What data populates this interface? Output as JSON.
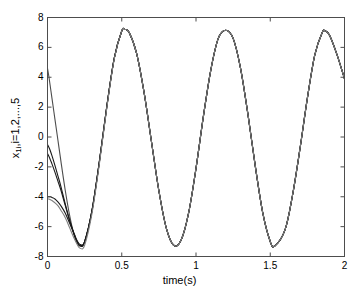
{
  "figure": {
    "background_color": "#ffffff",
    "axis_color": "#4d4d4d",
    "text_color": "#000000"
  },
  "axes": {
    "xlabel": "time(s)",
    "ylabel_prefix": "x",
    "ylabel_sub": "1i",
    "ylabel_suffix": ",i=1,2,...,5",
    "ylabel_full": "x1i,i=1,2,...,5",
    "xticks": [
      "0",
      "0.5",
      "1",
      "1.5",
      "2"
    ],
    "yticks": [
      "8",
      "6",
      "4",
      "2",
      "0",
      "-2",
      "-4",
      "-6",
      "-8"
    ]
  },
  "chart_data": {
    "type": "line",
    "title": "",
    "xlabel": "time(s)",
    "ylabel": "x1i,i=1,2,...,5",
    "xlim": [
      0,
      2
    ],
    "ylim": [
      -8,
      8
    ],
    "xticks": [
      0,
      0.5,
      1,
      1.5,
      2
    ],
    "yticks": [
      -8,
      -6,
      -4,
      -2,
      0,
      2,
      4,
      6,
      8
    ],
    "grid": false,
    "legend": "none",
    "annotations": [],
    "steady_state": {
      "amplitude": 7.2,
      "period": 0.675,
      "peaks_t": [
        0.52,
        1.2,
        1.87
      ],
      "peaks_y": [
        7.2,
        7.15,
        7.1
      ],
      "troughs_t": [
        0.85,
        1.53
      ],
      "troughs_y": [
        -7.25,
        -7.3
      ]
    },
    "series": [
      {
        "name": "x11",
        "color": "#4d4d4d",
        "initial_value": 4.6,
        "x": [
          0,
          0.01,
          0.02,
          0.03,
          0.05,
          0.07,
          0.09,
          0.12,
          0.15,
          0.18,
          0.2,
          0.22,
          0.25,
          0.3,
          0.35,
          0.4,
          0.45,
          0.5,
          0.52,
          0.55,
          0.6,
          0.65,
          0.7,
          0.75,
          0.8,
          0.85,
          0.9,
          0.95,
          1.0,
          1.05,
          1.1,
          1.15,
          1.2,
          1.25,
          1.3,
          1.35,
          1.4,
          1.45,
          1.5,
          1.53,
          1.6,
          1.65,
          1.7,
          1.75,
          1.8,
          1.85,
          1.87,
          1.9,
          1.95,
          2.0
        ],
        "y": [
          4.6,
          4.0,
          3.3,
          2.6,
          1.2,
          -0.2,
          -1.6,
          -3.6,
          -5.3,
          -6.6,
          -7.1,
          -7.3,
          -7.0,
          -4.9,
          -1.6,
          2.1,
          5.3,
          7.1,
          7.2,
          7.0,
          5.6,
          3.0,
          -0.3,
          -3.6,
          -6.1,
          -7.25,
          -6.9,
          -5.1,
          -2.1,
          1.4,
          4.5,
          6.6,
          7.15,
          6.6,
          4.6,
          1.5,
          -2.0,
          -5.1,
          -7.0,
          -7.3,
          -6.2,
          -3.9,
          -0.8,
          2.6,
          5.5,
          7.0,
          7.1,
          6.8,
          5.5,
          3.9
        ]
      },
      {
        "name": "x12",
        "color": "#1a1a1a",
        "initial_value": -0.5,
        "x": [
          0,
          0.01,
          0.02,
          0.03,
          0.05,
          0.07,
          0.09,
          0.12,
          0.15,
          0.18,
          0.2,
          0.22,
          0.25,
          0.3,
          0.35,
          0.4,
          0.45,
          0.5,
          0.52,
          0.55,
          0.6,
          0.65,
          0.7,
          0.75,
          0.8,
          0.85,
          0.9,
          0.95,
          1.0,
          1.05,
          1.1,
          1.15,
          1.2,
          1.25,
          1.3,
          1.35,
          1.4,
          1.45,
          1.5,
          1.53,
          1.6,
          1.65,
          1.7,
          1.75,
          1.8,
          1.85,
          1.87,
          1.9,
          1.95,
          2.0
        ],
        "y": [
          -0.5,
          -0.7,
          -0.95,
          -1.25,
          -1.9,
          -2.6,
          -3.3,
          -4.5,
          -5.6,
          -6.5,
          -7.0,
          -7.25,
          -7.0,
          -4.9,
          -1.6,
          2.1,
          5.3,
          7.1,
          7.2,
          7.0,
          5.6,
          3.0,
          -0.3,
          -3.6,
          -6.1,
          -7.25,
          -6.9,
          -5.1,
          -2.1,
          1.4,
          4.5,
          6.6,
          7.15,
          6.6,
          4.6,
          1.5,
          -2.0,
          -5.1,
          -7.0,
          -7.3,
          -6.2,
          -3.9,
          -0.8,
          2.6,
          5.5,
          7.0,
          7.1,
          6.8,
          5.5,
          3.9
        ]
      },
      {
        "name": "x13",
        "color": "#1a1a1a",
        "initial_value": -1.1,
        "x": [
          0,
          0.01,
          0.02,
          0.03,
          0.05,
          0.07,
          0.09,
          0.12,
          0.15,
          0.18,
          0.2,
          0.22,
          0.25,
          0.3,
          0.35,
          0.4,
          0.45,
          0.5,
          0.52,
          0.55,
          0.6,
          0.65,
          0.7,
          0.75,
          0.8,
          0.85,
          0.9,
          0.95,
          1.0,
          1.05,
          1.1,
          1.15,
          1.2,
          1.25,
          1.3,
          1.35,
          1.4,
          1.45,
          1.5,
          1.53,
          1.6,
          1.65,
          1.7,
          1.75,
          1.8,
          1.85,
          1.87,
          1.9,
          1.95,
          2.0
        ],
        "y": [
          -1.1,
          -1.3,
          -1.55,
          -1.8,
          -2.35,
          -2.95,
          -3.55,
          -4.6,
          -5.65,
          -6.55,
          -7.05,
          -7.3,
          -7.05,
          -4.9,
          -1.6,
          2.1,
          5.3,
          7.1,
          7.2,
          7.0,
          5.6,
          3.0,
          -0.3,
          -3.6,
          -6.1,
          -7.25,
          -6.9,
          -5.1,
          -2.1,
          1.4,
          4.5,
          6.6,
          7.15,
          6.6,
          4.6,
          1.5,
          -2.0,
          -5.1,
          -7.0,
          -7.3,
          -6.2,
          -3.9,
          -0.8,
          2.6,
          5.5,
          7.0,
          7.1,
          6.8,
          5.5,
          3.9
        ]
      },
      {
        "name": "x14",
        "color": "#1a1a1a",
        "initial_value": -4.0,
        "x": [
          0,
          0.01,
          0.02,
          0.03,
          0.05,
          0.07,
          0.09,
          0.12,
          0.15,
          0.18,
          0.2,
          0.22,
          0.25,
          0.3,
          0.35,
          0.4,
          0.45,
          0.5,
          0.52,
          0.55,
          0.6,
          0.65,
          0.7,
          0.75,
          0.8,
          0.85,
          0.9,
          0.95,
          1.0,
          1.05,
          1.1,
          1.15,
          1.2,
          1.25,
          1.3,
          1.35,
          1.4,
          1.45,
          1.5,
          1.53,
          1.6,
          1.65,
          1.7,
          1.75,
          1.8,
          1.85,
          1.87,
          1.9,
          1.95,
          2.0
        ],
        "y": [
          -4.0,
          -4.0,
          -4.0,
          -4.05,
          -4.15,
          -4.35,
          -4.6,
          -5.1,
          -5.8,
          -6.5,
          -6.95,
          -7.2,
          -7.0,
          -4.95,
          -1.65,
          2.05,
          5.3,
          7.1,
          7.2,
          7.0,
          5.6,
          3.0,
          -0.3,
          -3.6,
          -6.1,
          -7.25,
          -6.9,
          -5.1,
          -2.1,
          1.4,
          4.5,
          6.6,
          7.15,
          6.6,
          4.6,
          1.5,
          -2.0,
          -5.1,
          -7.0,
          -7.3,
          -6.2,
          -3.9,
          -0.8,
          2.6,
          5.5,
          7.0,
          7.1,
          6.8,
          5.5,
          3.9
        ]
      },
      {
        "name": "x15",
        "color": "#808080",
        "initial_value": -4.15,
        "x": [
          0,
          0.01,
          0.02,
          0.03,
          0.05,
          0.07,
          0.09,
          0.12,
          0.15,
          0.18,
          0.2,
          0.22,
          0.25,
          0.3,
          0.35,
          0.4,
          0.45,
          0.5,
          0.52,
          0.55,
          0.6,
          0.65,
          0.7,
          0.75,
          0.8,
          0.85,
          0.9,
          0.95,
          1.0,
          1.05,
          1.1,
          1.15,
          1.2,
          1.25,
          1.3,
          1.35,
          1.4,
          1.45,
          1.5,
          1.53,
          1.6,
          1.65,
          1.7,
          1.75,
          1.8,
          1.85,
          1.87,
          1.9,
          1.95,
          2.0
        ],
        "y": [
          -4.15,
          -4.15,
          -4.2,
          -4.25,
          -4.4,
          -4.6,
          -4.9,
          -5.4,
          -6.1,
          -6.8,
          -7.2,
          -7.45,
          -7.25,
          -5.1,
          -1.75,
          2.0,
          5.25,
          7.1,
          7.2,
          7.0,
          5.6,
          3.0,
          -0.3,
          -3.6,
          -6.1,
          -7.25,
          -6.9,
          -5.1,
          -2.1,
          1.4,
          4.5,
          6.6,
          7.15,
          6.6,
          4.6,
          1.5,
          -2.0,
          -5.1,
          -7.0,
          -7.3,
          -6.2,
          -3.9,
          -0.8,
          2.6,
          5.5,
          7.0,
          7.1,
          6.8,
          5.5,
          3.9
        ]
      }
    ]
  }
}
